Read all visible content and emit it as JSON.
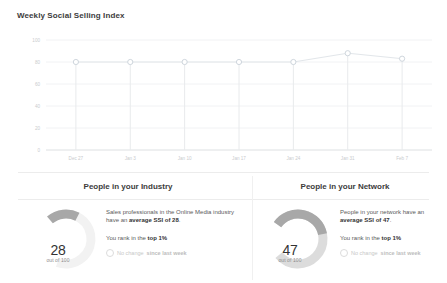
{
  "header": {
    "title": "Weekly Social Selling Index"
  },
  "chart_data": {
    "type": "line",
    "title": "Weekly Social Selling Index",
    "xlabel": "",
    "ylabel": "",
    "ylim": [
      0,
      100
    ],
    "grid": true,
    "legend": false,
    "categories": [
      "Dec 27",
      "Jan 3",
      "Jan 10",
      "Jan 17",
      "Jan 24",
      "Jan 31",
      "Feb 7"
    ],
    "yticks": [
      "0",
      "20",
      "40",
      "60",
      "80",
      "100"
    ],
    "ytick_values": [
      0,
      20,
      40,
      60,
      80,
      100
    ],
    "series": [
      {
        "name": "Social Selling Index",
        "values": [
          80,
          80,
          80,
          80,
          80,
          88,
          83
        ]
      }
    ],
    "marker": "open-circle",
    "marker_color": "#cfd6dd",
    "line_color": "#e2e6ea"
  },
  "sections": {
    "industry": {
      "heading": "People in your Industry",
      "gauge": {
        "value": "28",
        "out_of": "out of 100",
        "value_number": 28,
        "max": 100,
        "arc_color": "#a8a8a8",
        "track_color": "#f2f2f2"
      },
      "description_pre": "Sales professionals in the Online Media industry have an ",
      "description_bold": "average SSI of 28",
      "description_post": ".",
      "rank_pre": "You rank in the ",
      "rank_bold": "top 1%",
      "change_pre": "No change ",
      "change_bold": "since last week"
    },
    "network": {
      "heading": "People in your Network",
      "gauge": {
        "value": "47",
        "out_of": "out of 100",
        "value_number": 47,
        "max": 100,
        "arc_color": "#a8a8a8",
        "track_color": "#dcdcdc"
      },
      "description_pre": "People in your network have an ",
      "description_bold": "average SSI of 47",
      "description_post": ".",
      "rank_pre": "You rank in the ",
      "rank_bold": "top 1%",
      "change_pre": "No change ",
      "change_bold": "since last week"
    }
  }
}
